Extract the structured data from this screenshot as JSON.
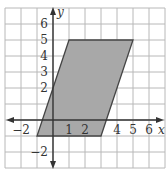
{
  "chart_data": {
    "type": "polygon",
    "title": "",
    "xlabel": "x",
    "ylabel": "y",
    "xlim": [
      -3,
      7
    ],
    "ylim": [
      -3,
      7
    ],
    "grid": true,
    "x_tick_labels": [
      "-2",
      "1",
      "2",
      "4",
      "5",
      "6"
    ],
    "x_tick_values": [
      -2,
      1,
      2,
      4,
      5,
      6
    ],
    "y_tick_labels": [
      "6",
      "5",
      "4",
      "3",
      "2",
      "-2"
    ],
    "y_tick_values": [
      6,
      5,
      4,
      3,
      2,
      -2
    ],
    "shapes": [
      {
        "name": "parallelogram",
        "vertices": [
          [
            -1,
            -1
          ],
          [
            3,
            -1
          ],
          [
            5,
            5
          ],
          [
            1,
            5
          ]
        ],
        "fill": "#a8a8a8",
        "stroke": "#444444"
      }
    ]
  },
  "colors": {
    "grid": "#b8b8b8",
    "axis": "#333333",
    "shape_fill": "#a8a8a8",
    "shape_stroke": "#444444"
  }
}
